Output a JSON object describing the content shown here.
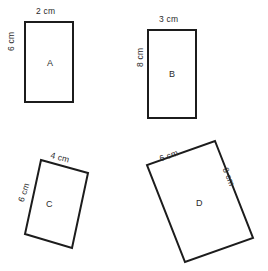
{
  "figure": {
    "type": "geometry-diagram",
    "stroke_color": "#1c1c1c",
    "fill_color": "#ffffff",
    "background_color": "#ffffff",
    "unit": "cm"
  },
  "shapes": [
    {
      "id": "A",
      "name": "rectangle-a",
      "label": "A",
      "orientation": "upright",
      "label_x": 47,
      "label_y": 58,
      "points": "25,22 73,22 73,102 25,102",
      "dimensions": [
        {
          "name": "width-label",
          "text": "2 cm",
          "x": 36,
          "y": 6,
          "rotation": 0
        },
        {
          "name": "height-label",
          "text": "6 cm",
          "x": 6,
          "y": 51,
          "rotation": -90
        }
      ]
    },
    {
      "id": "B",
      "name": "rectangle-b",
      "label": "B",
      "orientation": "upright",
      "label_x": 169,
      "label_y": 69,
      "points": "148,30 196,30 196,118 148,118",
      "dimensions": [
        {
          "name": "width-label",
          "text": "3 cm",
          "x": 159,
          "y": 14,
          "rotation": 0
        },
        {
          "name": "height-label",
          "text": "8 cm",
          "x": 129,
          "y": 67,
          "rotation": -90
        }
      ]
    },
    {
      "id": "C",
      "name": "rectangle-c-tilted",
      "label": "C",
      "orientation": "tilted",
      "label_x": 46,
      "label_y": 199,
      "points": "41,160 88,173 72,248 25,234",
      "dimensions": [
        {
          "name": "width-label",
          "text": "4 cm",
          "x": 52,
          "y": 152,
          "rotation": 15
        },
        {
          "name": "height-label",
          "text": "6 cm",
          "x": 9,
          "y": 185,
          "rotation": -72
        }
      ]
    },
    {
      "id": "D",
      "name": "rectangle-d-tilted",
      "label": "D",
      "orientation": "tilted",
      "label_x": 196,
      "label_y": 198,
      "points": "215,141 253,238 185,262 147,165"
    }
  ],
  "d_dimensions": [
    {
      "name": "width-label",
      "text": "6 cm",
      "x": 160,
      "y": 145,
      "rotation": -20
    },
    {
      "name": "height-label",
      "text": "8 cm",
      "x": 228,
      "y": 172,
      "rotation": 68
    }
  ]
}
